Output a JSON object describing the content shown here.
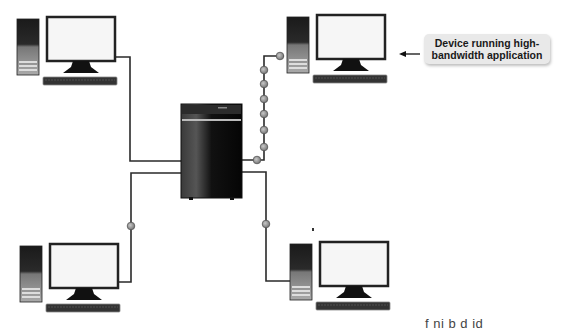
{
  "diagram": {
    "type": "network-topology",
    "central_node": {
      "label": "",
      "kind": "server-tower"
    },
    "devices": [
      {
        "id": "top-left",
        "kind": "desktop-computer"
      },
      {
        "id": "top-right",
        "kind": "desktop-computer",
        "high_bandwidth": true
      },
      {
        "id": "bottom-left",
        "kind": "desktop-computer"
      },
      {
        "id": "bottom-right",
        "kind": "desktop-computer"
      }
    ],
    "links": [
      {
        "from": "server",
        "to": "top-left",
        "packets": 0
      },
      {
        "from": "server",
        "to": "top-right",
        "packets": 7
      },
      {
        "from": "server",
        "to": "bottom-left",
        "packets": 1
      },
      {
        "from": "server",
        "to": "bottom-right",
        "packets": 1
      }
    ],
    "callout": {
      "line1": "Device running high-",
      "line2": "bandwidth application",
      "points_to": "top-right"
    },
    "cutoff_caption": "f    ni  b  d id   "
  },
  "colors": {
    "link": "#2a2a2a",
    "packet": "#9a9a9a",
    "callout_bg": "#e9e9e9",
    "server": "#111111"
  }
}
